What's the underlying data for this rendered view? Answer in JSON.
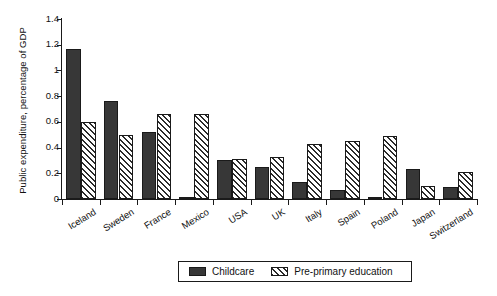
{
  "chart_data": {
    "type": "bar",
    "title": "",
    "xlabel": "",
    "ylabel": "Public expenditure, percentage of GDP",
    "ylim": [
      0,
      1.4
    ],
    "yticks": [
      "0",
      "0.2",
      "0.4",
      "0.6",
      "0.8",
      "1",
      "1.2",
      "1.4"
    ],
    "ytick_values": [
      0,
      0.2,
      0.4,
      0.6,
      0.8,
      1.0,
      1.2,
      1.4
    ],
    "grid": false,
    "legend_position": "bottom-center",
    "categories": [
      "Iceland",
      "Sweden",
      "France",
      "Mexico",
      "USA",
      "UK",
      "Italy",
      "Spain",
      "Poland",
      "Japan",
      "Switzerland"
    ],
    "series": [
      {
        "name": "Childcare",
        "color": "#373737",
        "fill": "solid",
        "values": [
          1.17,
          0.76,
          0.52,
          0.01,
          0.3,
          0.25,
          0.13,
          0.07,
          0.01,
          0.23,
          0.09
        ]
      },
      {
        "name": "Pre-primary education",
        "color": "#f2f2f2",
        "fill": "diagonal-hatch",
        "values": [
          0.6,
          0.5,
          0.66,
          0.66,
          0.31,
          0.33,
          0.43,
          0.45,
          0.49,
          0.1,
          0.21
        ]
      }
    ]
  },
  "legend": {
    "items": [
      {
        "label": "Childcare"
      },
      {
        "label": "Pre-primary education"
      }
    ]
  }
}
